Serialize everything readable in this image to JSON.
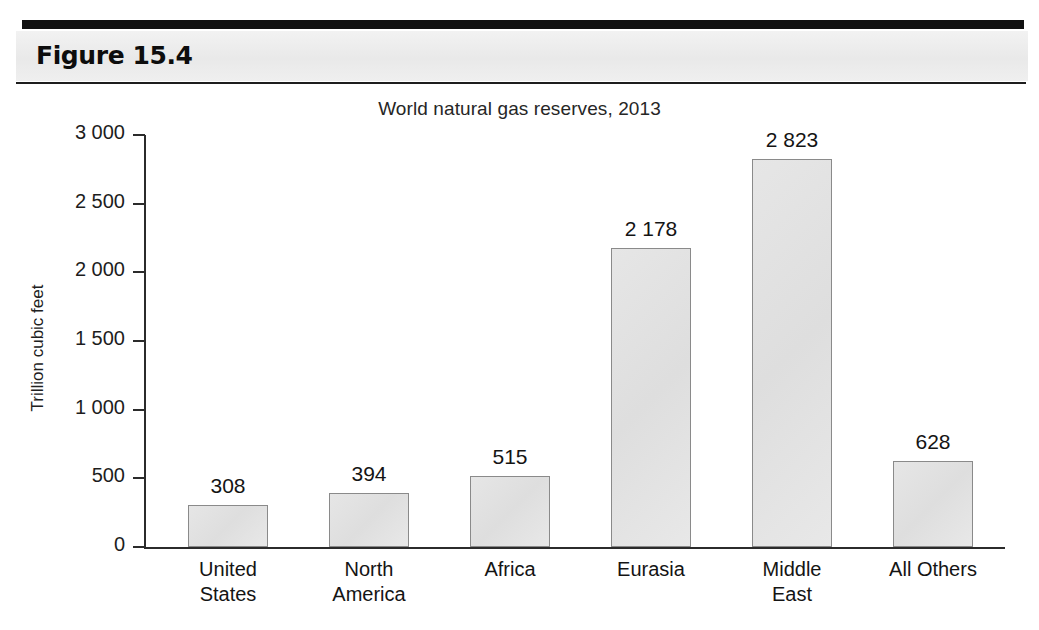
{
  "figure": {
    "label": "Figure 15.4"
  },
  "chart_data": {
    "type": "bar",
    "title": "World natural gas reserves, 2013",
    "xlabel": "",
    "ylabel": "Trillion cubic feet",
    "ylim": [
      0,
      3000
    ],
    "grid": false,
    "legend": null,
    "categories": [
      "United States",
      "North America",
      "Africa",
      "Eurasia",
      "Middle East",
      "All Others"
    ],
    "category_lines": [
      [
        "United",
        "States"
      ],
      [
        "North",
        "America"
      ],
      [
        "Africa"
      ],
      [
        "Eurasia"
      ],
      [
        "Middle",
        "East"
      ],
      [
        "All Others"
      ]
    ],
    "values": [
      308,
      394,
      515,
      2178,
      2823,
      628
    ],
    "value_labels": [
      "308",
      "394",
      "515",
      "2 178",
      "2 823",
      "628"
    ],
    "ytick_values": [
      0,
      500,
      1000,
      1500,
      2000,
      2500,
      3000
    ],
    "ytick_labels": [
      "0",
      "500",
      "1 000",
      "1 500",
      "2 000",
      "2 500",
      "3 000"
    ],
    "bar_fill": "#e4e4e4",
    "bar_stroke": "#8a8a8a",
    "axis_color": "#2b2b2b"
  }
}
